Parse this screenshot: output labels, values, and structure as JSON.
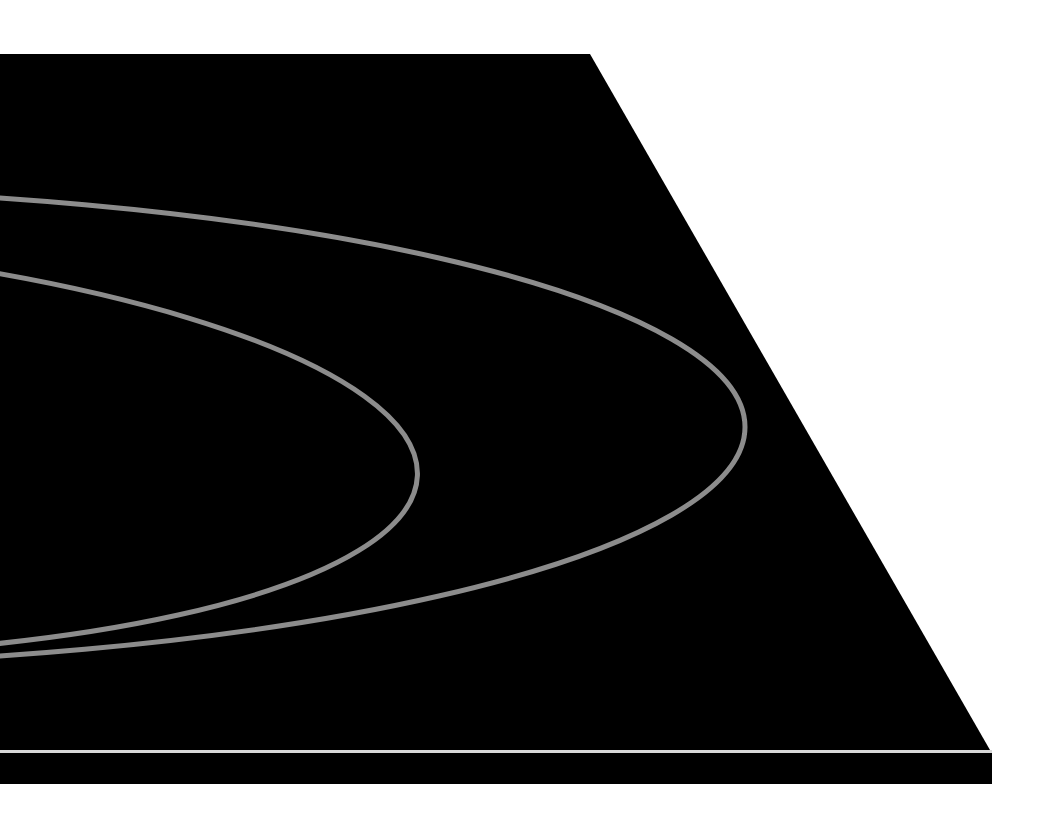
{
  "scene": {
    "background": "#ffffff",
    "surface_color": "#000000",
    "line_color": "#8c8c8c",
    "highlight_color": "#d8d8d8",
    "stroke_width": 5
  }
}
